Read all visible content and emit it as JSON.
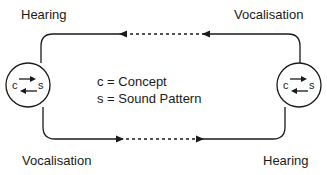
{
  "labels": {
    "top_left": "Hearing",
    "top_right": "Vocalisation",
    "bottom_left": "Vocalisation",
    "bottom_right": "Hearing"
  },
  "legend": {
    "concept": "c = Concept",
    "sound": "s = Sound Pattern"
  },
  "nodes": {
    "left": {
      "c": "c",
      "s": "s"
    },
    "right": {
      "c": "c",
      "s": "s"
    }
  },
  "colors": {
    "line": "#1a1a1a",
    "background": "#ffffff"
  }
}
